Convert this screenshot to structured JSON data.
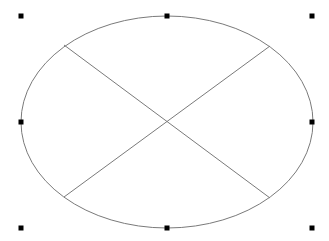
{
  "diagram": {
    "shape": "ellipse",
    "stroke_color": "#7a7a7a",
    "handle_color": "#000000",
    "ellipse": {
      "cx": 167,
      "cy": 122,
      "rx": 146,
      "ry": 106
    },
    "cross_lines": [
      {
        "x1": 64,
        "y1": 45,
        "x2": 270,
        "y2": 198
      },
      {
        "x1": 270,
        "y1": 46,
        "x2": 64,
        "y2": 197
      }
    ],
    "selection_handles": [
      {
        "name": "handle-top-left",
        "x": 21,
        "y": 16
      },
      {
        "name": "handle-top-center",
        "x": 167,
        "y": 16
      },
      {
        "name": "handle-top-right",
        "x": 312,
        "y": 16
      },
      {
        "name": "handle-middle-left",
        "x": 21,
        "y": 122
      },
      {
        "name": "handle-middle-right",
        "x": 312,
        "y": 122
      },
      {
        "name": "handle-bottom-left",
        "x": 21,
        "y": 228
      },
      {
        "name": "handle-bottom-center",
        "x": 167,
        "y": 228
      },
      {
        "name": "handle-bottom-right",
        "x": 312,
        "y": 228
      }
    ]
  }
}
